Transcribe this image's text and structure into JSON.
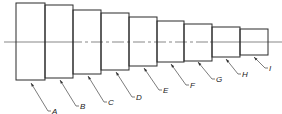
{
  "diagram": {
    "type": "stepped-shaft",
    "centerline_y": 42,
    "line_color": "#2b2b2b",
    "blocks": [
      {
        "label": "A",
        "x": 16,
        "w": 29,
        "top": 3,
        "bottom": 80
      },
      {
        "label": "B",
        "x": 45,
        "w": 28,
        "top": 5,
        "bottom": 78
      },
      {
        "label": "C",
        "x": 73,
        "w": 28,
        "top": 10,
        "bottom": 74
      },
      {
        "label": "D",
        "x": 101,
        "w": 28,
        "top": 13,
        "bottom": 70
      },
      {
        "label": "E",
        "x": 129,
        "w": 28,
        "top": 17,
        "bottom": 66
      },
      {
        "label": "F",
        "x": 157,
        "w": 27,
        "top": 21,
        "bottom": 62
      },
      {
        "label": "G",
        "x": 184,
        "w": 28,
        "top": 24,
        "bottom": 61
      },
      {
        "label": "H",
        "x": 212,
        "w": 28,
        "top": 27,
        "bottom": 57
      },
      {
        "label": "I",
        "x": 240,
        "w": 28,
        "top": 29,
        "bottom": 55
      }
    ],
    "leaders": [
      {
        "label": "A",
        "x1": 31,
        "y1": 83,
        "x2": 48,
        "y2": 111,
        "tx": 52,
        "ty": 114
      },
      {
        "label": "B",
        "x1": 60,
        "y1": 80,
        "x2": 76,
        "y2": 106,
        "tx": 80,
        "ty": 109
      },
      {
        "label": "C",
        "x1": 88,
        "y1": 76,
        "x2": 104,
        "y2": 102,
        "tx": 108,
        "ty": 105
      },
      {
        "label": "D",
        "x1": 116,
        "y1": 72,
        "x2": 132,
        "y2": 97,
        "tx": 136,
        "ty": 100
      },
      {
        "label": "E",
        "x1": 144,
        "y1": 68,
        "x2": 159,
        "y2": 90,
        "tx": 163,
        "ty": 93
      },
      {
        "label": "F",
        "x1": 171,
        "y1": 64,
        "x2": 186,
        "y2": 85,
        "tx": 190,
        "ty": 88
      },
      {
        "label": "G",
        "x1": 198,
        "y1": 62,
        "x2": 212,
        "y2": 79,
        "tx": 216,
        "ty": 82
      },
      {
        "label": "H",
        "x1": 226,
        "y1": 59,
        "x2": 238,
        "y2": 74,
        "tx": 242,
        "ty": 77
      },
      {
        "label": "I",
        "x1": 254,
        "y1": 57,
        "x2": 265,
        "y2": 68,
        "tx": 269,
        "ty": 71
      }
    ]
  }
}
